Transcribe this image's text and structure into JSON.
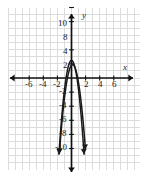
{
  "chart_data": {
    "type": "line",
    "title": "",
    "subtitle": "",
    "xlabel": "x",
    "ylabel": "y",
    "xlim": [
      -7.5,
      7.5
    ],
    "ylim": [
      -12.5,
      12.0
    ],
    "grid": true,
    "grid_step": 1,
    "grid_color": "#d8d8d8",
    "axis_color": "#111111",
    "curve_color": "#1a1a1a",
    "background": "#ffffff",
    "legend": "none",
    "x_ticks": [
      -6,
      -4,
      -2,
      2,
      4,
      6
    ],
    "x_tick_labels": [
      "-6",
      "-4",
      "-2",
      "2",
      "4",
      "6"
    ],
    "y_ticks": [
      10,
      8,
      4,
      2,
      -2,
      -4,
      -6,
      -8,
      -10
    ],
    "y_tick_labels": [
      "10",
      "8",
      "4",
      "2",
      "-2",
      "-4",
      "-6",
      "-8",
      "-10"
    ],
    "series": [
      {
        "name": "parabola-1",
        "type": "parabola",
        "direction": "down",
        "vertex": [
          0,
          2.5
        ],
        "a": -4.2,
        "x_range": [
          -1.78,
          1.78
        ],
        "arrow_ends": "both"
      },
      {
        "name": "parabola-2",
        "type": "parabola",
        "direction": "down",
        "vertex": [
          0.15,
          1.9
        ],
        "a": -3.6,
        "x_range": [
          -1.72,
          1.98
        ],
        "arrow_ends": "both"
      }
    ],
    "annotations": []
  },
  "axis_labels": {
    "x": "x",
    "y": "y"
  },
  "tick_positions_px": {
    "x_labels": [
      {
        "text": "-6",
        "x": 25,
        "y": 80
      },
      {
        "text": "-4",
        "x": 39,
        "y": 80
      },
      {
        "text": "-2",
        "x": 53,
        "y": 80
      },
      {
        "text": "2",
        "x": 84,
        "y": 80
      },
      {
        "text": "4",
        "x": 98,
        "y": 80
      },
      {
        "text": "6",
        "x": 112,
        "y": 80
      }
    ],
    "y_labels": [
      {
        "text": "10",
        "x": 58,
        "y": 19
      },
      {
        "text": "8",
        "x": 63,
        "y": 33
      },
      {
        "text": "4",
        "x": 63,
        "y": 47
      },
      {
        "text": "2",
        "x": 63,
        "y": 61
      },
      {
        "text": "-2",
        "x": 59,
        "y": 87
      },
      {
        "text": "-4",
        "x": 59,
        "y": 101
      },
      {
        "text": "-6",
        "x": 59,
        "y": 115
      },
      {
        "text": "-8",
        "x": 59,
        "y": 129
      },
      {
        "text": "-10",
        "x": 55,
        "y": 143
      }
    ],
    "axis_name_x": {
      "text": "x",
      "x": 123,
      "y": 63
    },
    "axis_name_y": {
      "text": "y",
      "x": 82,
      "y": 11
    }
  }
}
